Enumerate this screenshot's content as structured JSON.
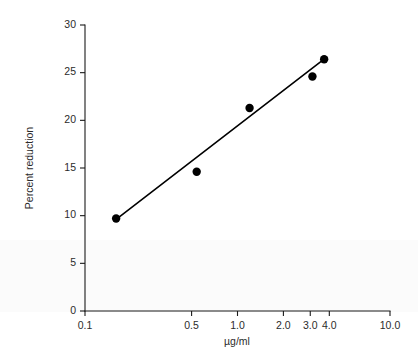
{
  "chart_data": {
    "type": "scatter",
    "title": "",
    "xlabel": "µg/ml",
    "ylabel": "Percent reduction",
    "xscale": "log",
    "yscale": "linear",
    "xlim": [
      0.1,
      10.0
    ],
    "ylim": [
      0,
      30
    ],
    "grid": false,
    "legend": null,
    "x_ticks": [
      {
        "value": 0.1,
        "label": "0.1"
      },
      {
        "value": 0.5,
        "label": "0.5"
      },
      {
        "value": 1.0,
        "label": "1.0"
      },
      {
        "value": 2.0,
        "label": "2.0"
      },
      {
        "value": 3.0,
        "label": "3.0"
      },
      {
        "value": 4.0,
        "label": "4.0"
      },
      {
        "value": 10.0,
        "label": "10.0"
      }
    ],
    "y_ticks": [
      {
        "value": 0,
        "label": "0"
      },
      {
        "value": 5,
        "label": "5"
      },
      {
        "value": 10,
        "label": "10"
      },
      {
        "value": 15,
        "label": "15"
      },
      {
        "value": 20,
        "label": "20"
      },
      {
        "value": 25,
        "label": "25"
      },
      {
        "value": 30,
        "label": "30"
      }
    ],
    "series": [
      {
        "name": "Percent reduction vs concentration",
        "marker": "filled-circle",
        "marker_color": "#000000",
        "x": [
          0.16,
          0.54,
          1.2,
          3.1,
          3.7
        ],
        "y": [
          9.7,
          14.6,
          21.3,
          24.6,
          26.4
        ]
      }
    ],
    "fit_line": {
      "name": "regression-line",
      "color": "#000000",
      "x_start": 0.16,
      "y_start": 9.6,
      "x_end": 3.75,
      "y_end": 26.5
    }
  },
  "axes": {
    "y_axis_label": "Percent reduction",
    "x_axis_label": "µg/ml"
  }
}
